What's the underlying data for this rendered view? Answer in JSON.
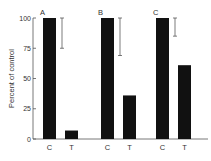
{
  "chart_data": {
    "type": "bar",
    "title": "",
    "xlabel": "",
    "ylabel": "Percent of control",
    "ylim": [
      0,
      100
    ],
    "yticks": [
      0,
      25,
      50,
      75,
      100
    ],
    "grid": false,
    "panels": [
      {
        "label": "A",
        "categories": [
          "C",
          "T"
        ],
        "values": [
          100,
          7
        ],
        "error_bar": {
          "on": "C",
          "low": 75,
          "high": 100
        }
      },
      {
        "label": "B",
        "categories": [
          "C",
          "T"
        ],
        "values": [
          100,
          36
        ],
        "error_bar": {
          "on": "C",
          "low": 69,
          "high": 100
        }
      },
      {
        "label": "C",
        "categories": [
          "C",
          "T"
        ],
        "values": [
          100,
          61
        ],
        "error_bar": {
          "on": "C",
          "low": 85,
          "high": 100
        }
      }
    ],
    "bar_color": "#111111"
  }
}
